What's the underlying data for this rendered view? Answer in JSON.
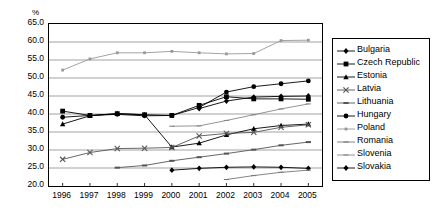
{
  "chart_data": {
    "type": "line",
    "title": "",
    "subtitle": "",
    "xlabel": "",
    "ylabel": "%",
    "y_unit_label": "%",
    "x": [
      1996,
      1997,
      1998,
      1999,
      2000,
      2001,
      2002,
      2003,
      2004,
      2005
    ],
    "categories": [
      "1996",
      "1997",
      "1998",
      "1999",
      "2000",
      "2001",
      "2002",
      "2003",
      "2004",
      "2005"
    ],
    "xlim": [
      1995.5,
      2005.5
    ],
    "ylim": [
      20.0,
      65.0
    ],
    "yticks": [
      "20.0",
      "25.0",
      "30.0",
      "35.0",
      "40.0",
      "45.0",
      "50.0",
      "55.0",
      "60.0",
      "65.0"
    ],
    "ytick_values": [
      20.0,
      25.0,
      30.0,
      35.0,
      40.0,
      45.0,
      50.0,
      55.0,
      60.0,
      65.0
    ],
    "grid": true,
    "grid_axis": "y",
    "legend_position": "right",
    "series": [
      {
        "name": "Bulgaria",
        "marker": "diamond",
        "color": "#000000",
        "values": [
          null,
          null,
          null,
          null,
          24.4,
          24.9,
          25.2,
          25.3,
          25.2,
          24.9
        ]
      },
      {
        "name": "Czech Republic",
        "marker": "square",
        "color": "#000000",
        "values": [
          40.8,
          39.6,
          40.1,
          39.8,
          39.6,
          42.4,
          44.8,
          44.2,
          44.2,
          44.1
        ]
      },
      {
        "name": "Estonia",
        "marker": "triangle",
        "color": "#000000",
        "values": [
          37.2,
          39.5,
          40.1,
          39.8,
          30.8,
          31.9,
          34.2,
          35.9,
          36.8,
          37.2
        ]
      },
      {
        "name": "Latvia",
        "marker": "cross",
        "color": "#555555",
        "values": [
          27.4,
          29.3,
          30.4,
          30.5,
          30.7,
          33.9,
          34.6,
          34.9,
          36.3,
          37.0
        ]
      },
      {
        "name": "Lithuania",
        "marker": "dash",
        "color": "#555555",
        "values": [
          null,
          null,
          25.1,
          25.7,
          27.0,
          28.0,
          29.0,
          30.1,
          31.3,
          32.2
        ]
      },
      {
        "name": "Hungary",
        "marker": "circle",
        "color": "#000000",
        "values": [
          39.1,
          39.6,
          39.9,
          39.5,
          39.6,
          41.8,
          46.1,
          47.6,
          48.4,
          49.2
        ]
      },
      {
        "name": "Poland",
        "marker": "dot",
        "color": "#999999",
        "values": [
          52.2,
          55.3,
          57.0,
          57.0,
          57.4,
          57.0,
          56.7,
          56.8,
          60.4,
          60.5
        ]
      },
      {
        "name": "Romania",
        "marker": "line",
        "color": "#777777",
        "values": [
          null,
          null,
          null,
          null,
          null,
          null,
          21.8,
          22.9,
          23.8,
          24.4
        ]
      },
      {
        "name": "Slovenia",
        "marker": "line",
        "color": "#888888",
        "values": [
          null,
          null,
          null,
          null,
          36.6,
          36.7,
          38.2,
          39.8,
          41.4,
          42.8
        ]
      },
      {
        "name": "Slovakia",
        "marker": "diamond-filled",
        "color": "#000000",
        "values": [
          null,
          null,
          null,
          null,
          null,
          41.5,
          43.6,
          44.7,
          44.9,
          45.0
        ]
      }
    ]
  },
  "legend": {
    "items": [
      {
        "label": "Bulgaria"
      },
      {
        "label": "Czech Republic"
      },
      {
        "label": "Estonia"
      },
      {
        "label": "Latvia"
      },
      {
        "label": "Lithuania"
      },
      {
        "label": "Hungary"
      },
      {
        "label": "Poland"
      },
      {
        "label": "Romania"
      },
      {
        "label": "Slovenia"
      },
      {
        "label": "Slovakia"
      }
    ]
  }
}
